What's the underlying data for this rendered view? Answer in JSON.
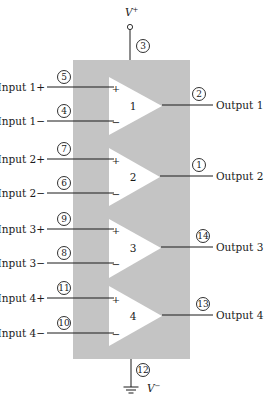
{
  "diagram": {
    "colors": {
      "package": "#c4c4c4",
      "amplifier": "#ffffff",
      "ink": "#1a1a1a"
    },
    "package": {
      "x": 73,
      "y": 60,
      "width": 117,
      "height": 299
    },
    "supply_positive": {
      "label": "V+",
      "label_main": "V",
      "label_sup": "+",
      "pin": "3",
      "x": 130,
      "terminal_y": 27,
      "label_y": 16,
      "pin_cx": 143,
      "pin_cy": 46
    },
    "supply_negative": {
      "label": "V−",
      "label_main": "V",
      "label_sup": "−",
      "pin": "12",
      "x": 131,
      "ground_y": 387,
      "pin_cx": 143,
      "pin_cy": 370,
      "label_x": 147,
      "label_y": 392
    },
    "amplifiers": [
      {
        "number": "1",
        "top": 77,
        "bottom": 135,
        "left": 109,
        "tip_x": 162,
        "tip_y": 106,
        "input_plus": {
          "label": "Input 1+",
          "pin": "5",
          "y": 87
        },
        "input_minus": {
          "label": "Input 1−",
          "pin": "4",
          "y": 121
        },
        "output": {
          "label": "Output 1",
          "pin": "2",
          "y": 105,
          "pin_cy": 94
        }
      },
      {
        "number": "2",
        "top": 148,
        "bottom": 206,
        "left": 109,
        "tip_x": 160,
        "tip_y": 177,
        "input_plus": {
          "label": "Input 2+",
          "pin": "7",
          "y": 159
        },
        "input_minus": {
          "label": "Input 2−",
          "pin": "6",
          "y": 193
        },
        "output": {
          "label": "Output 2",
          "pin": "1",
          "y": 176,
          "pin_cy": 165
        }
      },
      {
        "number": "3",
        "top": 219,
        "bottom": 278,
        "left": 109,
        "tip_x": 161,
        "tip_y": 248,
        "input_plus": {
          "label": "Input 3+",
          "pin": "9",
          "y": 229
        },
        "input_minus": {
          "label": "Input 3−",
          "pin": "8",
          "y": 263
        },
        "output": {
          "label": "Output 3",
          "pin": "14",
          "y": 247,
          "pin_cy": 236
        }
      },
      {
        "number": "4",
        "top": 286,
        "bottom": 346,
        "left": 109,
        "tip_x": 162,
        "tip_y": 316,
        "input_plus": {
          "label": "Input 4+",
          "pin": "11",
          "y": 298
        },
        "input_minus": {
          "label": "Input 4−",
          "pin": "10",
          "y": 333
        },
        "output": {
          "label": "Output 4",
          "pin": "13",
          "y": 315,
          "pin_cy": 304
        }
      }
    ],
    "signs": {
      "plus": "+",
      "minus": "−"
    }
  }
}
